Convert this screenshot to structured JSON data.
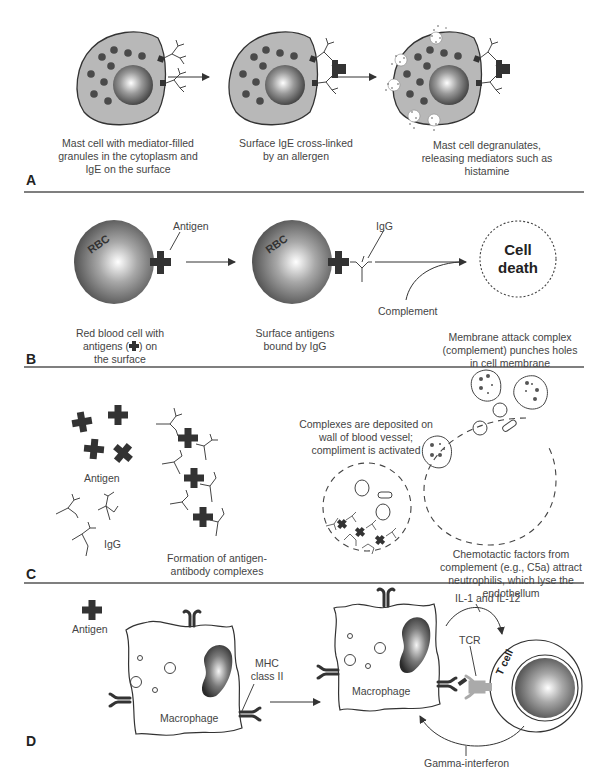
{
  "figure": {
    "panels": [
      {
        "id": "A",
        "captions": [
          "Mast cell with mediator-filled granules in the cytoplasm and IgE on the surface",
          "Surface IgE cross-linked by an allergen",
          "Mast cell degranulates, releasing mediators such as histamine"
        ]
      },
      {
        "id": "B",
        "labels": {
          "rbc1": "RBC",
          "rbc2": "RBC",
          "antigen": "Antigen",
          "igg": "IgG",
          "complement": "Complement",
          "cell_death_1": "Cell",
          "cell_death_2": "death"
        },
        "captions": {
          "c1_a": "Red blood cell with",
          "c1_b": "antigens (",
          "c1_c": ") on",
          "c1_d": "the surface",
          "c2": "Surface antigens bound by IgG",
          "c3": "Membrane attack complex (complement) punches holes in cell membrane"
        }
      },
      {
        "id": "C",
        "labels": {
          "antigen": "Antigen",
          "igg": "IgG"
        },
        "captions": [
          "Formation of antigen-antibody complexes",
          "Complexes are deposited on wall of blood vessel; compliment is activated",
          "Chemotactic factors from complement (e.g., C5a) attract neutrophilis, which lyse the endothellum"
        ]
      },
      {
        "id": "D",
        "labels": {
          "antigen": "Antigen",
          "macrophage1": "Macrophage",
          "macrophage2": "Macrophage",
          "mhc": "MHC class II",
          "il": "IL-1 and IL-12",
          "tcr": "TCR",
          "tcell": "T cell",
          "gamma": "Gamma-interferon"
        }
      }
    ]
  },
  "colors": {
    "cell_fill": "#b8b8b8",
    "granule": "#4a4a4a",
    "ink": "#3a3a3a",
    "divider": "#555555"
  }
}
